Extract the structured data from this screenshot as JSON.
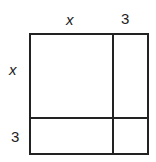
{
  "diagram": {
    "type": "area-model",
    "top_labels": [
      "x",
      "3"
    ],
    "side_labels": [
      "x",
      "3"
    ],
    "regions": [
      {
        "row": "x",
        "col": "x"
      },
      {
        "row": "x",
        "col": "3"
      },
      {
        "row": "3",
        "col": "x"
      },
      {
        "row": "3",
        "col": "3"
      }
    ],
    "colors": {
      "line": "#222222",
      "background": "#ffffff"
    }
  }
}
